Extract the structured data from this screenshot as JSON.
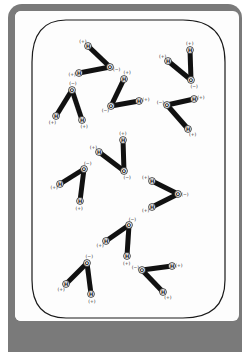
{
  "figure": {
    "title": "",
    "colors": {
      "frame": "#7a7a7a",
      "panel": "#fdfdfd",
      "bond": "#111111",
      "outline": "#1a1a1a"
    },
    "labels": {
      "oxygen": "O",
      "hydrogen": "H",
      "oxygen_charge": "(−)",
      "hydrogen_charge": "(+)"
    },
    "molecules": [
      {
        "id": "A",
        "O": [
          110,
          67
        ],
        "H": [
          [
            88,
            46
          ],
          [
            79,
            73
          ]
        ]
      },
      {
        "id": "B",
        "O": [
          72,
          90
        ],
        "H": [
          [
            56,
            116
          ],
          [
            82,
            120
          ]
        ]
      },
      {
        "id": "C",
        "O": [
          111,
          106
        ],
        "H": [
          [
            124,
            79
          ],
          [
            139,
            101
          ]
        ]
      },
      {
        "id": "D",
        "O": [
          191,
          80
        ],
        "H": [
          [
            190,
            50
          ],
          [
            168,
            61
          ]
        ]
      },
      {
        "id": "E",
        "O": [
          167,
          105
        ],
        "H": [
          [
            194,
            99
          ],
          [
            188,
            129
          ]
        ]
      },
      {
        "id": "F",
        "O": [
          124,
          171
        ],
        "H": [
          [
            123,
            140
          ],
          [
            99,
            152
          ]
        ]
      },
      {
        "id": "G",
        "O": [
          84,
          169
        ],
        "H": [
          [
            60,
            184
          ],
          [
            80,
            201
          ]
        ]
      },
      {
        "id": "H",
        "O": [
          178,
          194
        ],
        "H": [
          [
            152,
            181
          ],
          [
            152,
            207
          ]
        ]
      },
      {
        "id": "I",
        "O": [
          129,
          225
        ],
        "H": [
          [
            106,
            241
          ],
          [
            127,
            256
          ]
        ]
      },
      {
        "id": "J",
        "O": [
          87,
          263
        ],
        "H": [
          [
            66,
            284
          ],
          [
            91,
            294
          ]
        ]
      },
      {
        "id": "K",
        "O": [
          142,
          270
        ],
        "H": [
          [
            172,
            266
          ],
          [
            163,
            292
          ]
        ]
      }
    ]
  }
}
